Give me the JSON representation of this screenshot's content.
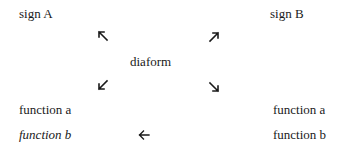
{
  "diagram": {
    "top_left": "sign A",
    "top_right": "sign B",
    "center": "diaform",
    "left_column": {
      "function_a": "function a",
      "function_b": "function b"
    },
    "right_column": {
      "function_a": "function a",
      "function_b": "function b"
    },
    "arrows": [
      {
        "name": "arrow-up-left-icon",
        "direction": "north-west",
        "glyph": "↖"
      },
      {
        "name": "arrow-up-right-icon",
        "direction": "north-east",
        "glyph": "↗"
      },
      {
        "name": "arrow-down-left-icon",
        "direction": "south-west",
        "glyph": "↙"
      },
      {
        "name": "arrow-down-right-icon",
        "direction": "south-east",
        "glyph": "↘"
      },
      {
        "name": "arrow-left-icon",
        "direction": "west",
        "glyph": "←"
      }
    ]
  }
}
